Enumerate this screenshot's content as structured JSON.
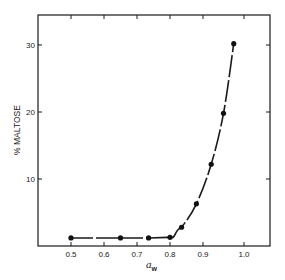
{
  "chart_data": {
    "type": "line",
    "title": "",
    "xlabel": "a_w",
    "xlabel_main": "a",
    "xlabel_sub": "w",
    "ylabel": "% MALTOSE",
    "xlim": [
      0.4,
      1.07
    ],
    "ylim": [
      0,
      34
    ],
    "grid": false,
    "legend": null,
    "x_ticks": [
      0.5,
      0.6,
      0.7,
      0.8,
      0.9,
      1.0
    ],
    "x_tick_labels": [
      "0.5",
      "0.6",
      "0.7",
      "0.8",
      "0.9",
      "1.0"
    ],
    "y_ticks": [
      10,
      20,
      30
    ],
    "y_tick_labels": [
      "10",
      "20",
      "30"
    ],
    "series": [
      {
        "name": "% maltose vs water activity",
        "marker": "filled-circle",
        "line": "smooth dashed-segments",
        "x": [
          0.5,
          0.65,
          0.735,
          0.8,
          0.835,
          0.88,
          0.92,
          0.95,
          0.975
        ],
        "y": [
          1.2,
          1.2,
          1.2,
          1.3,
          2.8,
          6.3,
          12.2,
          19.8,
          30.2
        ]
      }
    ]
  },
  "layout": {
    "frame": {
      "left": 38,
      "top": 15,
      "right": 270,
      "bottom": 246
    },
    "x_tick_px": [
      71,
      104,
      137,
      170,
      203,
      244
    ],
    "y_zero_px": 246,
    "y_px_per_unit": 6.7
  },
  "colors": {
    "ink": "#1a1a1a",
    "background": "#ffffff"
  }
}
